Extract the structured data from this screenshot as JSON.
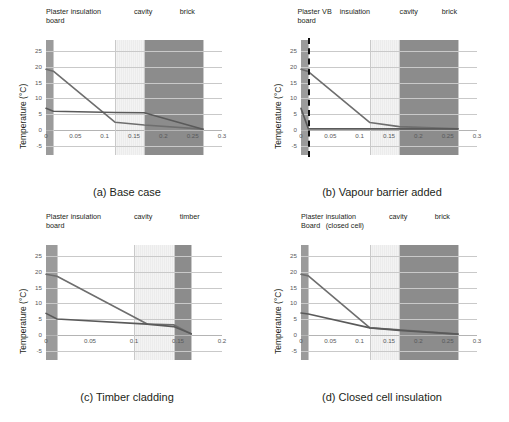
{
  "figure": {
    "ylabel": "Temperature (°C)",
    "yticks": [
      "25",
      "20",
      "15",
      "10",
      "5",
      "0",
      "-5"
    ],
    "ytick_values": [
      25,
      20,
      15,
      10,
      5,
      0,
      -5
    ],
    "ylim": [
      -8,
      28.5
    ]
  },
  "panels": [
    {
      "id": "a",
      "caption": "(a) Base case",
      "xticks": [
        "0",
        "0.05",
        "0.1",
        "0.15",
        "0.2",
        "0.25",
        "0.3"
      ],
      "xtick_values": [
        0,
        0.05,
        0.1,
        0.15,
        0.2,
        0.25,
        0.3
      ],
      "xlim": [
        0,
        0.3
      ],
      "layers": [
        {
          "name": "Plaster board",
          "label_lines": [
            "Plaster",
            "board"
          ],
          "x0": 0.0,
          "x1": 0.0125,
          "fill": "#9b9b9b"
        },
        {
          "name": "insulation",
          "label_lines": [
            "insulation"
          ],
          "x0": 0.0125,
          "x1": 0.1175,
          "fill": "#ffffff"
        },
        {
          "name": "cavity",
          "label_lines": [
            "cavity"
          ],
          "x0": 0.1175,
          "x1": 0.1675,
          "fill": "#ececec"
        },
        {
          "name": "brick",
          "label_lines": [
            "brick"
          ],
          "x0": 0.1675,
          "x1": 0.2675,
          "fill": "#8c8c8c"
        }
      ],
      "vapour_barrier": null
    },
    {
      "id": "b",
      "caption": "(b) Vapour barrier added",
      "xticks": [
        "0",
        "0.05",
        "0.1",
        "0.15",
        "0.2",
        "0.25",
        "0.3"
      ],
      "xtick_values": [
        0,
        0.05,
        0.1,
        0.15,
        0.2,
        0.25,
        0.3
      ],
      "xlim": [
        0,
        0.3
      ],
      "layers": [
        {
          "name": "Plaster board",
          "label_lines": [
            "Plaster",
            "board"
          ],
          "x0": 0.0,
          "x1": 0.0125,
          "fill": "#9b9b9b"
        },
        {
          "name": "VB",
          "label_lines": [
            "VB"
          ],
          "x0": 0.0125,
          "x1": 0.0125,
          "fill": "none"
        },
        {
          "name": "insulation",
          "label_lines": [
            "insulation"
          ],
          "x0": 0.0125,
          "x1": 0.1175,
          "fill": "#ffffff"
        },
        {
          "name": "cavity",
          "label_lines": [
            "cavity"
          ],
          "x0": 0.1175,
          "x1": 0.1675,
          "fill": "#ececec"
        },
        {
          "name": "brick",
          "label_lines": [
            "brick"
          ],
          "x0": 0.1675,
          "x1": 0.2675,
          "fill": "#8c8c8c"
        }
      ],
      "vapour_barrier": {
        "x": 0.0125,
        "style": "dashed",
        "color": "#111111"
      }
    },
    {
      "id": "c",
      "caption": "(c) Timber cladding",
      "xticks": [
        "0",
        "0.05",
        "0.1",
        "0.15",
        "0.2"
      ],
      "xtick_values": [
        0,
        0.05,
        0.1,
        0.15,
        0.2
      ],
      "xlim": [
        0,
        0.2
      ],
      "layers": [
        {
          "name": "Plaster board",
          "label_lines": [
            "Plaster",
            "board"
          ],
          "x0": 0.0,
          "x1": 0.0125,
          "fill": "#9b9b9b"
        },
        {
          "name": "insulation",
          "label_lines": [
            "insulation"
          ],
          "x0": 0.0125,
          "x1": 0.1,
          "fill": "#ffffff"
        },
        {
          "name": "cavity",
          "label_lines": [
            "cavity"
          ],
          "x0": 0.1,
          "x1": 0.145,
          "fill": "#ececec"
        },
        {
          "name": "timber",
          "label_lines": [
            "timber"
          ],
          "x0": 0.145,
          "x1": 0.165,
          "fill": "#8c8c8c"
        }
      ],
      "vapour_barrier": null
    },
    {
      "id": "d",
      "caption": "(d) Closed cell insulation",
      "xticks": [
        "0",
        "0.05",
        "0.1",
        "0.15",
        "0.2",
        "0.25",
        "0.3"
      ],
      "xtick_values": [
        0,
        0.05,
        0.1,
        0.15,
        0.2,
        0.25,
        0.3
      ],
      "xlim": [
        0,
        0.3
      ],
      "layers": [
        {
          "name": "Plaster board",
          "label_lines": [
            "Plaster",
            "Board"
          ],
          "x0": 0.0,
          "x1": 0.0125,
          "fill": "#9b9b9b"
        },
        {
          "name": "insulation (closed cell)",
          "label_lines": [
            "insulation",
            "(closed cell)"
          ],
          "x0": 0.0125,
          "x1": 0.1175,
          "fill": "#ffffff"
        },
        {
          "name": "cavity",
          "label_lines": [
            "cavity"
          ],
          "x0": 0.1175,
          "x1": 0.1675,
          "fill": "#ececec"
        },
        {
          "name": "brick",
          "label_lines": [
            "brick"
          ],
          "x0": 0.1675,
          "x1": 0.2675,
          "fill": "#8c8c8c"
        }
      ],
      "vapour_barrier": null
    }
  ],
  "chart_data": [
    {
      "type": "line",
      "panel": "a",
      "title": "(a) Base case",
      "xlabel": "",
      "ylabel": "Temperature (°C)",
      "xlim": [
        0,
        0.3
      ],
      "ylim": [
        -8,
        28.5
      ],
      "grid": true,
      "legend": "none",
      "series": [
        {
          "name": "temperature",
          "x": [
            0.0,
            0.0125,
            0.1175,
            0.1675,
            0.2675
          ],
          "y": [
            19.2,
            18.6,
            2.4,
            1.5,
            0.2
          ]
        },
        {
          "name": "dew point",
          "x": [
            0.0,
            0.0125,
            0.1175,
            0.1675,
            0.2675
          ],
          "y": [
            6.8,
            5.9,
            5.5,
            5.4,
            0.2
          ]
        }
      ]
    },
    {
      "type": "line",
      "panel": "b",
      "title": "(b) Vapour barrier added",
      "xlabel": "",
      "ylabel": "Temperature (°C)",
      "xlim": [
        0,
        0.3
      ],
      "ylim": [
        -8,
        28.5
      ],
      "grid": true,
      "legend": "none",
      "series": [
        {
          "name": "temperature",
          "x": [
            0.0,
            0.0125,
            0.1175,
            0.1675,
            0.2675
          ],
          "y": [
            19.2,
            18.5,
            2.3,
            1.0,
            0.3
          ]
        },
        {
          "name": "dew point",
          "x": [
            0.0,
            0.0125,
            0.1175,
            0.1675,
            0.2675
          ],
          "y": [
            6.8,
            0.3,
            0.3,
            0.3,
            0.3
          ]
        }
      ]
    },
    {
      "type": "line",
      "panel": "c",
      "title": "(c) Timber cladding",
      "xlabel": "",
      "ylabel": "Temperature (°C)",
      "xlim": [
        0,
        0.2
      ],
      "ylim": [
        -8,
        28.5
      ],
      "grid": true,
      "legend": "none",
      "series": [
        {
          "name": "temperature",
          "x": [
            0.0,
            0.0125,
            0.115,
            0.145,
            0.165
          ],
          "y": [
            19.2,
            18.6,
            3.4,
            3.2,
            0.3
          ]
        },
        {
          "name": "dew point",
          "x": [
            0.0,
            0.0125,
            0.115,
            0.145,
            0.165
          ],
          "y": [
            6.8,
            5.0,
            3.4,
            2.6,
            0.3
          ]
        }
      ]
    },
    {
      "type": "line",
      "panel": "d",
      "title": "(d) Closed cell insulation",
      "xlabel": "",
      "ylabel": "Temperature (°C)",
      "xlim": [
        0,
        0.3
      ],
      "ylim": [
        -8,
        28.5
      ],
      "grid": true,
      "legend": "none",
      "series": [
        {
          "name": "temperature",
          "x": [
            0.0,
            0.0125,
            0.1175,
            0.1675,
            0.2675
          ],
          "y": [
            19.2,
            18.7,
            2.2,
            1.6,
            0.2
          ]
        },
        {
          "name": "dew point",
          "x": [
            0.0,
            0.0125,
            0.1175,
            0.1675,
            0.2675
          ],
          "y": [
            6.9,
            6.6,
            2.2,
            1.4,
            0.2
          ]
        }
      ]
    }
  ],
  "style": {
    "line_color": "#6e6e6e",
    "line_color_dark": "#5a5a5a",
    "grid_color": "#c9c9c9",
    "text_color": "#231f20",
    "tick_color": "#58595b"
  }
}
